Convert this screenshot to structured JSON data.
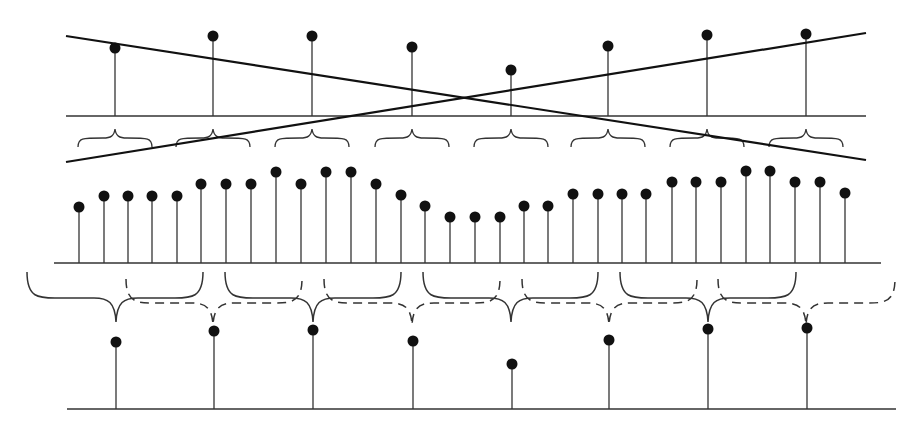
{
  "diagram": {
    "colors": {
      "ink": "#111111",
      "stem": "#333333",
      "background": "#ffffff"
    },
    "top_row": {
      "baseline_y": 116,
      "x_start": 66,
      "x_end": 866,
      "stems": [
        {
          "x": 115,
          "y": 48
        },
        {
          "x": 213,
          "y": 36
        },
        {
          "x": 312,
          "y": 36
        },
        {
          "x": 412,
          "y": 47
        },
        {
          "x": 511,
          "y": 70
        },
        {
          "x": 608,
          "y": 46
        },
        {
          "x": 707,
          "y": 35
        },
        {
          "x": 806,
          "y": 34
        }
      ],
      "braces_y": 138,
      "braces": [
        115,
        213,
        312,
        412,
        511,
        608,
        707,
        806
      ],
      "cross_lines": [
        {
          "x1": 66,
          "y1": 36,
          "x2": 866,
          "y2": 160
        },
        {
          "x1": 66,
          "y1": 162,
          "x2": 866,
          "y2": 33
        }
      ]
    },
    "middle_row": {
      "baseline_y": 263,
      "x_start": 54,
      "x_end": 881,
      "stems": [
        {
          "x": 79,
          "y": 207
        },
        {
          "x": 104,
          "y": 196
        },
        {
          "x": 128,
          "y": 196
        },
        {
          "x": 152,
          "y": 196
        },
        {
          "x": 177,
          "y": 196
        },
        {
          "x": 201,
          "y": 184
        },
        {
          "x": 226,
          "y": 184
        },
        {
          "x": 251,
          "y": 184
        },
        {
          "x": 276,
          "y": 172
        },
        {
          "x": 301,
          "y": 184
        },
        {
          "x": 326,
          "y": 172
        },
        {
          "x": 351,
          "y": 172
        },
        {
          "x": 376,
          "y": 184
        },
        {
          "x": 401,
          "y": 195
        },
        {
          "x": 425,
          "y": 206
        },
        {
          "x": 450,
          "y": 217
        },
        {
          "x": 475,
          "y": 217
        },
        {
          "x": 500,
          "y": 217
        },
        {
          "x": 524,
          "y": 206
        },
        {
          "x": 548,
          "y": 206
        },
        {
          "x": 573,
          "y": 194
        },
        {
          "x": 598,
          "y": 194
        },
        {
          "x": 622,
          "y": 194
        },
        {
          "x": 646,
          "y": 194
        },
        {
          "x": 672,
          "y": 182
        },
        {
          "x": 696,
          "y": 182
        },
        {
          "x": 721,
          "y": 182
        },
        {
          "x": 746,
          "y": 171
        },
        {
          "x": 770,
          "y": 171
        },
        {
          "x": 795,
          "y": 182
        },
        {
          "x": 820,
          "y": 182
        },
        {
          "x": 845,
          "y": 193
        }
      ]
    },
    "bottom_braces": {
      "solid": [
        {
          "left": 27,
          "right": 203,
          "tip": 116
        },
        {
          "left": 225,
          "right": 401,
          "tip": 313
        },
        {
          "left": 423,
          "right": 598,
          "tip": 511
        },
        {
          "left": 620,
          "right": 796,
          "tip": 708
        }
      ],
      "dashed": [
        {
          "left": 126,
          "right": 302,
          "tip": 213
        },
        {
          "left": 324,
          "right": 500,
          "tip": 412
        },
        {
          "left": 522,
          "right": 697,
          "tip": 609
        },
        {
          "left": 718,
          "right": 895,
          "tip": 806
        }
      ]
    },
    "bottom_row": {
      "baseline_y": 409,
      "x_start": 67,
      "x_end": 896,
      "stems": [
        {
          "x": 116,
          "y": 342
        },
        {
          "x": 214,
          "y": 331
        },
        {
          "x": 313,
          "y": 330
        },
        {
          "x": 413,
          "y": 341
        },
        {
          "x": 512,
          "y": 364
        },
        {
          "x": 609,
          "y": 340
        },
        {
          "x": 708,
          "y": 329
        },
        {
          "x": 807,
          "y": 328
        }
      ]
    }
  }
}
